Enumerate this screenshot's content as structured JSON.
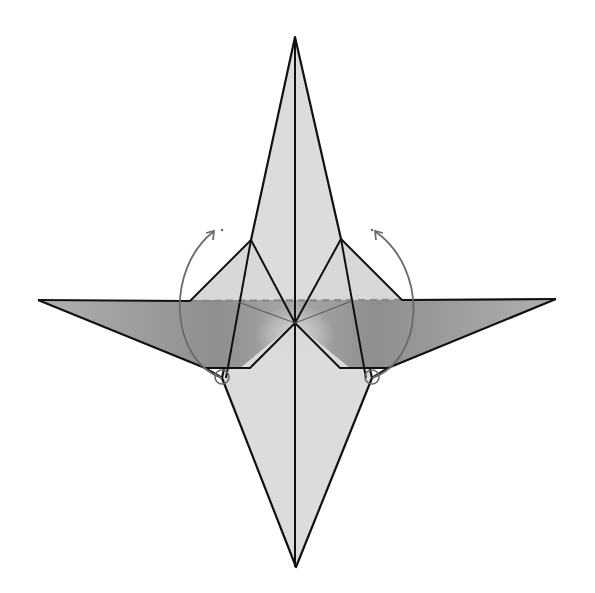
{
  "diagram": {
    "type": "origami-step",
    "colors": {
      "paper_light": "#dcdcdc",
      "paper_shaded": "#9a9a9a",
      "edge": "#111111",
      "arrow": "#6a6a6a",
      "valley_fold": "#8a8a8a",
      "background": "#ffffff"
    },
    "points": {
      "top_tip": [
        295,
        37
      ],
      "bottom_tip": [
        296,
        567
      ],
      "left_tip": [
        38,
        300
      ],
      "right_tip": [
        556,
        299
      ],
      "center": [
        295,
        323
      ],
      "left_flap_top": [
        251,
        240
      ],
      "right_flap_top": [
        341,
        239
      ],
      "left_flap_outer": [
        190,
        301
      ],
      "right_flap_outer": [
        402,
        300
      ],
      "left_pivot": [
        222,
        378
      ],
      "right_pivot": [
        372,
        378
      ]
    },
    "annotations": {
      "arrows": [
        {
          "name": "left-rotate-arrow",
          "direction": "counter-clockwise-up"
        },
        {
          "name": "right-rotate-arrow",
          "direction": "clockwise-up"
        }
      ],
      "pivot_circles": 2,
      "fold_lines": [
        "valley-fold-dashed-horizontal"
      ]
    }
  }
}
